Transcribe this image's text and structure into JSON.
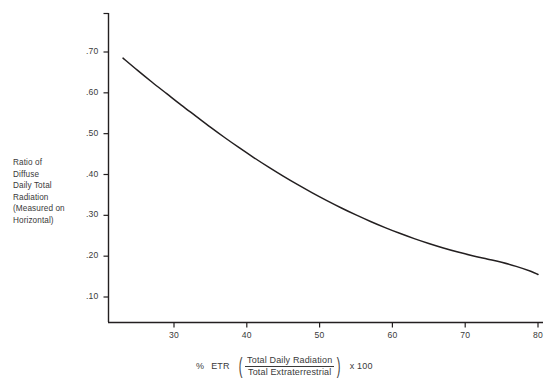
{
  "chart_data": {
    "type": "line",
    "title": "",
    "xlabel_parts": {
      "prefix_percent": "%",
      "prefix_etr": "ETR",
      "numerator": "Total Daily Radiation",
      "denominator": "Total Extraterrestrial",
      "multiplier": "x  100"
    },
    "xlabel": "% ETR (Total Daily Radiation / Total Extraterrestrial) x 100",
    "ylabel": "Ratio of Diffuse Daily Total Radiation (Measured on Horizontal)",
    "ylabel_lines": [
      "Ratio of",
      "Diffuse",
      "Daily Total",
      "Radiation",
      "(Measured on",
      "Horizontal)"
    ],
    "xlim": [
      22,
      80
    ],
    "ylim": [
      0.0,
      0.78
    ],
    "xticks": [
      30,
      40,
      50,
      60,
      70,
      80
    ],
    "xticklabels": [
      "30",
      "40",
      "50",
      "60",
      "70",
      "80"
    ],
    "yticks": [
      0.1,
      0.2,
      0.3,
      0.4,
      0.5,
      0.6,
      0.7
    ],
    "yticklabels": [
      ".10",
      ".20",
      ".30",
      ".40",
      ".50",
      ".60",
      ".70"
    ],
    "grid": false,
    "legend": null,
    "series": [
      {
        "name": "Diffuse ratio vs % ETR",
        "color": "#231f20",
        "x": [
          23,
          25,
          27,
          29,
          31,
          33,
          35,
          37,
          39,
          41,
          43,
          45,
          47,
          49,
          51,
          53,
          55,
          57,
          59,
          61,
          63,
          65,
          67,
          69,
          71,
          73,
          75,
          77,
          79,
          80
        ],
        "y": [
          0.685,
          0.655,
          0.626,
          0.598,
          0.57,
          0.543,
          0.516,
          0.49,
          0.465,
          0.441,
          0.418,
          0.396,
          0.375,
          0.355,
          0.336,
          0.318,
          0.301,
          0.285,
          0.27,
          0.256,
          0.243,
          0.231,
          0.22,
          0.21,
          0.201,
          0.193,
          0.185,
          0.175,
          0.163,
          0.155
        ]
      }
    ]
  },
  "axis": {
    "line_color": "#231f20",
    "tick_color": "#231f20"
  },
  "background": "#ffffff"
}
